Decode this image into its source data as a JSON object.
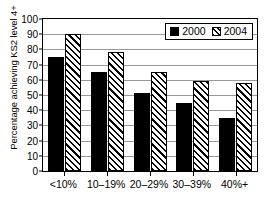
{
  "chart_data": {
    "type": "bar",
    "title": "",
    "xlabel": "",
    "ylabel": "Percentage achieving KS2 level 4+",
    "categories": [
      "<10%",
      "10–19%",
      "20–29%",
      "30–39%",
      "40%+"
    ],
    "series": [
      {
        "name": "2000",
        "values": [
          75,
          65,
          51,
          45,
          35
        ],
        "fill": "solid-black",
        "color": "#000000"
      },
      {
        "name": "2004",
        "values": [
          90,
          78,
          65,
          59,
          58
        ],
        "fill": "diagonal-hatch",
        "color": "#000000"
      }
    ],
    "ylim": [
      0,
      100
    ],
    "yticks": [
      0,
      10,
      20,
      30,
      40,
      50,
      60,
      70,
      80,
      90,
      100
    ],
    "ytick_labels": [
      "0",
      "10",
      "20",
      "30",
      "40",
      "50",
      "60",
      "70",
      "80",
      "90",
      "100"
    ],
    "grid": true,
    "grid_axis": "y",
    "grid_color": "#9a9a9a",
    "legend": {
      "position": "upper-right-inside",
      "entries": [
        "2000",
        "2004"
      ]
    },
    "frame": true,
    "background": "#ffffff"
  }
}
